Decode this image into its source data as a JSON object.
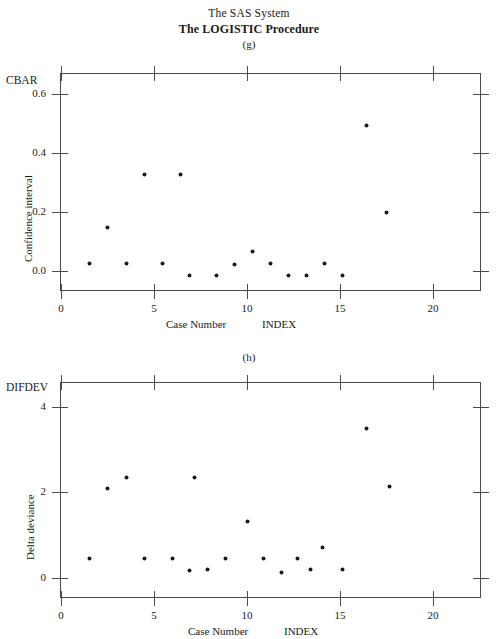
{
  "header": {
    "system_title": "The SAS System",
    "procedure_title": "The LOGISTIC Procedure"
  },
  "panels": [
    {
      "label": "(g)",
      "axis_corner_label": "CBAR",
      "ylabel": "Delta deviance placeholder"
    }
  ],
  "panel_g": {
    "label": "(g)",
    "corner_label": "CBAR",
    "ylabel": "Confidence interval",
    "xlabel_left": "Case Number",
    "xlabel_right": "INDEX",
    "ytick_labels": [
      "0.6",
      "0.4",
      "0.2",
      "0.0"
    ],
    "xtick_labels": [
      "0",
      "5",
      "10",
      "15",
      "20"
    ]
  },
  "panel_h": {
    "label": "(h)",
    "corner_label": "DIFDEV",
    "ylabel": "Delta deviance",
    "xlabel_left": "Case Number",
    "xlabel_right": "INDEX",
    "ytick_labels": [
      "4",
      "2",
      "0"
    ],
    "xtick_labels": [
      "0",
      "5",
      "10",
      "15",
      "20"
    ]
  },
  "chart_data": [
    {
      "type": "scatter",
      "panel": "(g)",
      "title": "The LOGISTIC Procedure",
      "xlabel": "Case Number",
      "ylabel": "Confidence interval",
      "y_axis_variable": "CBAR",
      "x_axis_variable": "INDEX",
      "xlim": [
        -0.6,
        22.6
      ],
      "ylim": [
        -0.06,
        0.66
      ],
      "xticks": [
        0,
        5,
        10,
        15,
        20
      ],
      "yticks": [
        0.0,
        0.2,
        0.4,
        0.6
      ],
      "grid": false,
      "legend": null,
      "marker": "filled-circle",
      "points": [
        {
          "x": 1,
          "y": 0.03
        },
        {
          "x": 2,
          "y": 0.15
        },
        {
          "x": 3,
          "y": 0.03
        },
        {
          "x": 4,
          "y": 0.325
        },
        {
          "x": 5,
          "y": 0.03
        },
        {
          "x": 6,
          "y": 0.325
        },
        {
          "x": 6.5,
          "y": -0.01
        },
        {
          "x": 8,
          "y": -0.01
        },
        {
          "x": 9,
          "y": 0.025
        },
        {
          "x": 10,
          "y": 0.07
        },
        {
          "x": 11,
          "y": 0.03
        },
        {
          "x": 12,
          "y": -0.01
        },
        {
          "x": 13,
          "y": -0.012
        },
        {
          "x": 14,
          "y": 0.03
        },
        {
          "x": 15,
          "y": -0.012
        },
        {
          "x": 16.3,
          "y": 0.49
        },
        {
          "x": 17.4,
          "y": 0.2
        }
      ]
    },
    {
      "type": "scatter",
      "panel": "(h)",
      "title": "The LOGISTIC Procedure",
      "xlabel": "Case Number",
      "ylabel": "Delta deviance",
      "y_axis_variable": "DIFDEV",
      "x_axis_variable": "INDEX",
      "xlim": [
        -0.6,
        22.6
      ],
      "ylim": [
        -0.45,
        4.6
      ],
      "xticks": [
        0,
        5,
        10,
        15,
        20
      ],
      "yticks": [
        0,
        2,
        4
      ],
      "grid": false,
      "legend": null,
      "marker": "filled-circle",
      "points": [
        {
          "x": 1,
          "y": 0.45
        },
        {
          "x": 2,
          "y": 2.1
        },
        {
          "x": 3,
          "y": 2.38
        },
        {
          "x": 4,
          "y": 0.45
        },
        {
          "x": 5.6,
          "y": 0.45
        },
        {
          "x": 6.5,
          "y": 0.18
        },
        {
          "x": 7.5,
          "y": 0.2
        },
        {
          "x": 6.8,
          "y": 2.38
        },
        {
          "x": 8.5,
          "y": 0.45
        },
        {
          "x": 9.7,
          "y": 1.33
        },
        {
          "x": 10.6,
          "y": 0.45
        },
        {
          "x": 11.6,
          "y": 0.13
        },
        {
          "x": 12.5,
          "y": 0.45
        },
        {
          "x": 13.2,
          "y": 0.2
        },
        {
          "x": 13.9,
          "y": 0.72
        },
        {
          "x": 15,
          "y": 0.2
        },
        {
          "x": 16.3,
          "y": 3.52
        },
        {
          "x": 17.6,
          "y": 2.15
        }
      ]
    }
  ]
}
